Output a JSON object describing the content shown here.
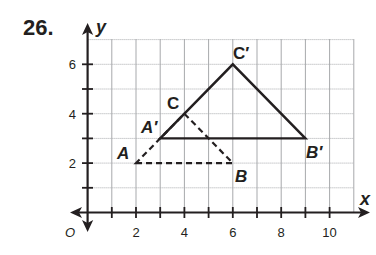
{
  "problem": {
    "number": "26."
  },
  "graph": {
    "x_axis_label": "x",
    "y_axis_label": "y",
    "origin_label": "O",
    "x_tick_labels": [
      "2",
      "4",
      "6",
      "8",
      "10"
    ],
    "y_tick_labels": [
      "2",
      "4",
      "6"
    ],
    "grid": {
      "x_min": 0,
      "x_max": 11,
      "y_min": 0,
      "y_max": 7,
      "step": 1
    },
    "colors": {
      "ink": "#231f20",
      "grid": "#a7a9ac"
    }
  },
  "figures": {
    "original_triangle": {
      "style": "dashed",
      "vertices": [
        {
          "label": "A",
          "x": 2,
          "y": 2
        },
        {
          "label": "B",
          "x": 6,
          "y": 2
        },
        {
          "label": "C",
          "x": 4,
          "y": 4
        }
      ]
    },
    "image_triangle": {
      "style": "solid",
      "vertices": [
        {
          "label": "A′",
          "x": 3,
          "y": 3
        },
        {
          "label": "B′",
          "x": 9,
          "y": 3
        },
        {
          "label": "C′",
          "x": 6,
          "y": 6
        }
      ]
    }
  }
}
